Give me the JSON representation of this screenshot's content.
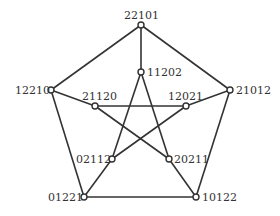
{
  "diagram": {
    "type": "graph",
    "name": "Petersen graph",
    "nodes": [
      {
        "id": "n0",
        "label": "22101",
        "x": 141,
        "y": 25
      },
      {
        "id": "n1",
        "label": "21012",
        "x": 230,
        "y": 90
      },
      {
        "id": "n2",
        "label": "10122",
        "x": 196,
        "y": 197
      },
      {
        "id": "n3",
        "label": "01221",
        "x": 84,
        "y": 197
      },
      {
        "id": "n4",
        "label": "12210",
        "x": 51,
        "y": 90
      },
      {
        "id": "n5",
        "label": "11202",
        "x": 141,
        "y": 72
      },
      {
        "id": "n6",
        "label": "12021",
        "x": 186,
        "y": 106
      },
      {
        "id": "n7",
        "label": "20211",
        "x": 169,
        "y": 159
      },
      {
        "id": "n8",
        "label": "02112",
        "x": 112,
        "y": 159
      },
      {
        "id": "n9",
        "label": "21120",
        "x": 95,
        "y": 106
      }
    ],
    "edges": [
      [
        "n0",
        "n1"
      ],
      [
        "n1",
        "n2"
      ],
      [
        "n2",
        "n3"
      ],
      [
        "n3",
        "n4"
      ],
      [
        "n4",
        "n0"
      ],
      [
        "n0",
        "n5"
      ],
      [
        "n1",
        "n6"
      ],
      [
        "n2",
        "n7"
      ],
      [
        "n3",
        "n8"
      ],
      [
        "n4",
        "n9"
      ],
      [
        "n5",
        "n8"
      ],
      [
        "n5",
        "n7"
      ],
      [
        "n9",
        "n6"
      ],
      [
        "n9",
        "n7"
      ],
      [
        "n6",
        "n8"
      ]
    ],
    "colors": {
      "stroke": "#333333",
      "node_fill": "#ffffff",
      "background": "#ffffff"
    }
  }
}
